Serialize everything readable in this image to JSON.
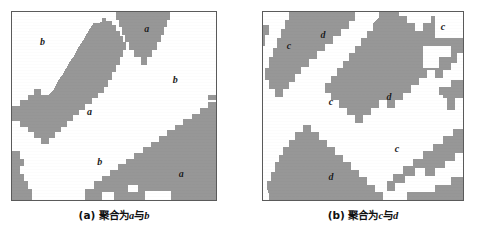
{
  "figure": {
    "kind": "two-panel-segmentation-figure",
    "background_color": "#ffffff",
    "cluster_color": "#979797",
    "background_region_color": "#ffffff",
    "border_color": "#5a5a5a"
  },
  "panels": [
    {
      "id": "a",
      "caption_tag": "(a)",
      "caption_text": "聚合为",
      "caption_var_1": "a",
      "caption_join": "与",
      "caption_var_2": "b",
      "caption_full": "(a) 聚合为a与b",
      "labels": [
        {
          "text": "b",
          "x": 15,
          "y": 16
        },
        {
          "text": "a",
          "x": 66,
          "y": 9
        },
        {
          "text": "a",
          "x": 38,
          "y": 53
        },
        {
          "text": "b",
          "x": 80,
          "y": 36
        },
        {
          "text": "b",
          "x": 43,
          "y": 80
        },
        {
          "text": "a",
          "x": 83,
          "y": 86
        }
      ],
      "cluster_polygons": [
        "M 27.5 0 L 27.5 3 L 29 3 L 29 6 L 30.5 6 L 30.5 9 L 32 9 L 32 12 L 33.5 12 L 33.5 15 L 35 15 L 35 18 L 36.5 18 L 36.5 21 L 38 21 L 38 24 L 36.5 24 L 36.5 27 L 35 27 L 35 30 L 33.5 30 L 33.5 33 L 32 33 L 32 30 L 30.5 30 L 30.5 27 L 29 27 L 29 24 L 27.5 24 L 27.5 21 L 26 21 L 26 18 L 24.5 18 L 24.5 15 L 23 15 L 23 12 L 21.5 12 L 21.5 9 L 20 9 L 20 6 L 18.5 6 L 18.5 3 L 17 3 L 17 0 Z",
        "M 40 3 L 40 0 L 28 0 L 28 4 L 30 7 L 31 11 L 33 14 L 34 18 L 36 21 L 37 24 L 38 21 L 39 17 L 40 13 Z"
      ],
      "description": "Diagonal thick gray band from mid-left to upper-center; gray wedge at top center; gray region occupying the lower-right quadrant; gray strip along lower-left edge."
    },
    {
      "id": "b",
      "caption_tag": "(b)",
      "caption_text": "聚合为",
      "caption_var_1": "c",
      "caption_join": "与",
      "caption_var_2": "d",
      "caption_full": "(b) 聚合为c与d",
      "labels": [
        {
          "text": "c",
          "x": 13,
          "y": 18
        },
        {
          "text": "d",
          "x": 30,
          "y": 12
        },
        {
          "text": "c",
          "x": 90,
          "y": 8
        },
        {
          "text": "c",
          "x": 34,
          "y": 48
        },
        {
          "text": "d",
          "x": 63,
          "y": 45
        },
        {
          "text": "c",
          "x": 67,
          "y": 73
        },
        {
          "text": "d",
          "x": 34,
          "y": 88
        }
      ],
      "description": "Broad gray band running from upper-left down the left side; large gray mass through the centre and right; white c-regions in the left-centre, top-right corner and lower-right; gray band along the bottom."
    }
  ]
}
